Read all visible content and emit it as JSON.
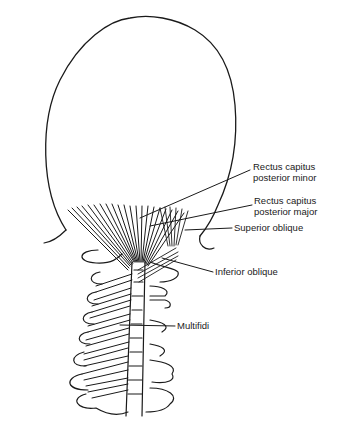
{
  "diagram": {
    "labels": [
      {
        "id": "rcp-minor",
        "line1": "Rectus capitus",
        "line2": "posterior minor"
      },
      {
        "id": "rcp-major",
        "line1": "Rectus capitus",
        "line2": "posterior major"
      },
      {
        "id": "superior-oblique",
        "line1": "Superior oblique"
      },
      {
        "id": "inferior-oblique",
        "line1": "Inferior oblique"
      },
      {
        "id": "multifidi",
        "line1": "Multifidi"
      }
    ],
    "colors": {
      "ink": "#1a1a1a",
      "background": "#ffffff"
    }
  }
}
